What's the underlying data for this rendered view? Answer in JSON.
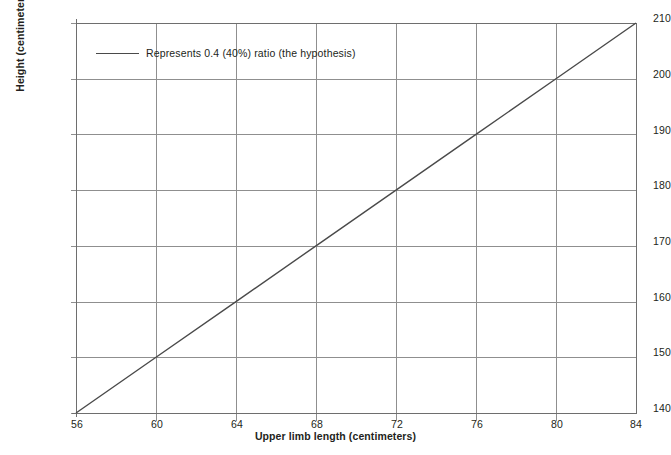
{
  "chart_data": {
    "type": "line",
    "title": "",
    "subtitle": "",
    "xlabel": "Upper limb length (centimeters)",
    "ylabel": "Height (centimeters)",
    "xlim": [
      56,
      84
    ],
    "ylim": [
      140,
      210
    ],
    "xticks": [
      56,
      60,
      64,
      68,
      72,
      76,
      80,
      84
    ],
    "yticks": [
      140,
      150,
      160,
      170,
      180,
      190,
      200,
      210
    ],
    "grid": true,
    "legend_position": "upper-left-inside",
    "series": [
      {
        "name": "Represents 0.4 (40%) ratio (the hypothesis)",
        "color": "#4a4a4a",
        "x": [
          56,
          60,
          64,
          68,
          72,
          76,
          80,
          84
        ],
        "values": [
          140,
          150,
          160,
          170,
          180,
          190,
          200,
          210
        ]
      }
    ],
    "annotations": []
  },
  "legend": {
    "entries": [
      {
        "label": "Represents 0.4 (40%) ratio (the hypothesis)"
      }
    ]
  },
  "axes": {
    "x": {
      "title": "Upper limb length (centimeters)",
      "ticks": [
        "56",
        "60",
        "64",
        "68",
        "72",
        "76",
        "80",
        "84"
      ]
    },
    "y": {
      "title": "Height (centimeters)",
      "ticks": [
        "140",
        "150",
        "160",
        "170",
        "180",
        "190",
        "200",
        "210"
      ]
    }
  },
  "colors": {
    "background": "#ffffff",
    "grid": "#8f8f8f",
    "axis": "#6e6e6e",
    "series": "#4a4a4a",
    "text": "#231f20"
  }
}
